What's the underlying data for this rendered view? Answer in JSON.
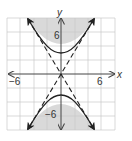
{
  "diagram": {
    "type": "hyperbola-inequality-graph",
    "axes": {
      "x_label": "x",
      "y_label": "y",
      "x_tick_labels": [
        "−6",
        "6"
      ],
      "y_tick_labels": [
        "6",
        "−6"
      ]
    },
    "colors": {
      "shade": "#d9d9d9",
      "grid": "#c8c8c8",
      "curve": "#222222",
      "axis": "#444444"
    },
    "curve": "solid hyperbola opening up/down with vertices at (0, 2.5) and (0, -2.5)",
    "asymptotes": "dashed lines through origin",
    "shading": "inside both branches (above upper branch, below lower branch)"
  }
}
